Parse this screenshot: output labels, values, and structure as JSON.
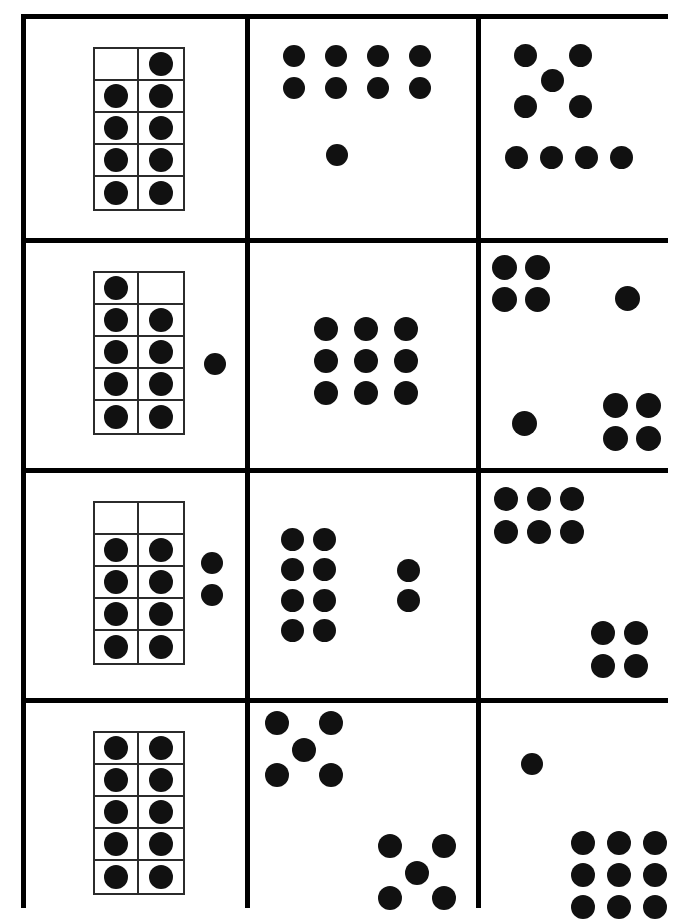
{
  "worksheet": {
    "title": "Ten-frame and dot pattern counting worksheet",
    "description": "A 3-column by 4-row grid of white cards on a black grid; each card shows a quantity of nine or ten black dots arranged in a different representation.",
    "ink_color": "#111111",
    "grid_color": "#000000",
    "card_color": "#ffffff",
    "frame_line_color": "#2b2b2b",
    "columns": 3,
    "rows": 4,
    "cards": [
      {
        "id": "r1c1",
        "row": 1,
        "column": 1,
        "representation": "ten-frame",
        "total_dots": 9,
        "filled_cells": 9,
        "empty_cells": 1,
        "empty_positions": "top-left",
        "groups": [
          {
            "label": "ten-frame",
            "count": 9
          }
        ]
      },
      {
        "id": "r1c2",
        "row": 1,
        "column": 2,
        "representation": "scattered-groups",
        "total_dots": 9,
        "groups": [
          {
            "label": "4-by-2 array",
            "count": 8
          },
          {
            "label": "single dot below",
            "count": 1
          }
        ]
      },
      {
        "id": "r1c3",
        "row": 1,
        "column": 3,
        "representation": "scattered-groups",
        "total_dots": 9,
        "groups": [
          {
            "label": "quincunx",
            "count": 5
          },
          {
            "label": "row of four",
            "count": 4
          }
        ]
      },
      {
        "id": "r2c1",
        "row": 2,
        "column": 1,
        "representation": "ten-frame-plus-loose",
        "total_dots": 10,
        "filled_cells": 9,
        "empty_cells": 1,
        "empty_positions": "top-right",
        "loose_dots": 1,
        "groups": [
          {
            "label": "ten-frame",
            "count": 9
          },
          {
            "label": "loose dots",
            "count": 1
          }
        ]
      },
      {
        "id": "r2c2",
        "row": 2,
        "column": 2,
        "representation": "array",
        "total_dots": 9,
        "groups": [
          {
            "label": "3-by-3 array",
            "count": 9
          }
        ]
      },
      {
        "id": "r2c3",
        "row": 2,
        "column": 3,
        "representation": "scattered-groups",
        "total_dots": 10,
        "groups": [
          {
            "label": "2-by-2 array top-left",
            "count": 4
          },
          {
            "label": "single dot top-right",
            "count": 1
          },
          {
            "label": "single dot bottom-left",
            "count": 1
          },
          {
            "label": "2-by-2 array bottom-right",
            "count": 4
          }
        ]
      },
      {
        "id": "r3c1",
        "row": 3,
        "column": 1,
        "representation": "ten-frame-plus-loose",
        "total_dots": 10,
        "filled_cells": 8,
        "empty_cells": 2,
        "empty_positions": "entire top row",
        "loose_dots": 2,
        "groups": [
          {
            "label": "ten-frame",
            "count": 8
          },
          {
            "label": "loose dots",
            "count": 2
          }
        ]
      },
      {
        "id": "r3c2",
        "row": 3,
        "column": 2,
        "representation": "scattered-groups",
        "total_dots": 10,
        "groups": [
          {
            "label": "4-by-2 array",
            "count": 8
          },
          {
            "label": "vertical pair",
            "count": 2
          }
        ]
      },
      {
        "id": "r3c3",
        "row": 3,
        "column": 3,
        "representation": "scattered-groups",
        "total_dots": 10,
        "groups": [
          {
            "label": "2-by-3 array top-left",
            "count": 6
          },
          {
            "label": "2-by-2 array bottom-right",
            "count": 4
          }
        ]
      },
      {
        "id": "r4c1",
        "row": 4,
        "column": 1,
        "representation": "ten-frame",
        "total_dots": 10,
        "filled_cells": 10,
        "empty_cells": 0,
        "empty_positions": "none",
        "groups": [
          {
            "label": "ten-frame",
            "count": 10
          }
        ]
      },
      {
        "id": "r4c2",
        "row": 4,
        "column": 2,
        "representation": "scattered-groups",
        "total_dots": 10,
        "groups": [
          {
            "label": "quincunx top-left",
            "count": 5
          },
          {
            "label": "quincunx bottom-right",
            "count": 5
          }
        ]
      },
      {
        "id": "r4c3",
        "row": 4,
        "column": 3,
        "representation": "scattered-groups",
        "total_dots": 10,
        "groups": [
          {
            "label": "single dot top-left",
            "count": 1
          },
          {
            "label": "3-by-3 array bottom-right",
            "count": 9
          }
        ]
      }
    ],
    "dot_layouts": {
      "r1c2": [
        [
          33,
          26,
          22
        ],
        [
          75,
          26,
          22
        ],
        [
          117,
          26,
          22
        ],
        [
          159,
          26,
          22
        ],
        [
          33,
          58,
          22
        ],
        [
          75,
          58,
          22
        ],
        [
          117,
          58,
          22
        ],
        [
          159,
          58,
          22
        ],
        [
          76,
          125,
          22
        ]
      ],
      "r1c3": [
        [
          33,
          25,
          23
        ],
        [
          88,
          25,
          23
        ],
        [
          60,
          50,
          23
        ],
        [
          33,
          76,
          23
        ],
        [
          88,
          76,
          23
        ],
        [
          24,
          127,
          23
        ],
        [
          59,
          127,
          23
        ],
        [
          94,
          127,
          23
        ],
        [
          129,
          127,
          23
        ]
      ],
      "r2c1_loose": [
        [
          178,
          110,
          22
        ]
      ],
      "r2c2": [
        [
          64,
          74,
          24
        ],
        [
          104,
          74,
          24
        ],
        [
          144,
          74,
          24
        ],
        [
          64,
          106,
          24
        ],
        [
          104,
          106,
          24
        ],
        [
          144,
          106,
          24
        ],
        [
          64,
          138,
          24
        ],
        [
          104,
          138,
          24
        ],
        [
          144,
          138,
          24
        ]
      ],
      "r2c3": [
        [
          11,
          12,
          25
        ],
        [
          44,
          12,
          25
        ],
        [
          11,
          44,
          25
        ],
        [
          44,
          44,
          25
        ],
        [
          134,
          43,
          25
        ],
        [
          31,
          168,
          25
        ],
        [
          122,
          150,
          25
        ],
        [
          155,
          150,
          25
        ],
        [
          122,
          183,
          25
        ],
        [
          155,
          183,
          25
        ]
      ],
      "r3c1_loose": [
        [
          175,
          79,
          22
        ],
        [
          175,
          111,
          22
        ]
      ],
      "r3c2": [
        [
          31,
          55,
          23
        ],
        [
          63,
          55,
          23
        ],
        [
          31,
          85,
          23
        ],
        [
          63,
          85,
          23
        ],
        [
          31,
          116,
          23
        ],
        [
          63,
          116,
          23
        ],
        [
          31,
          146,
          23
        ],
        [
          63,
          146,
          23
        ],
        [
          147,
          86,
          23
        ],
        [
          147,
          116,
          23
        ]
      ],
      "r3c3": [
        [
          13,
          14,
          24
        ],
        [
          46,
          14,
          24
        ],
        [
          79,
          14,
          24
        ],
        [
          13,
          47,
          24
        ],
        [
          46,
          47,
          24
        ],
        [
          79,
          47,
          24
        ],
        [
          110,
          148,
          24
        ],
        [
          143,
          148,
          24
        ],
        [
          110,
          181,
          24
        ],
        [
          143,
          181,
          24
        ]
      ],
      "r4c2": [
        [
          15,
          8,
          24
        ],
        [
          69,
          8,
          24
        ],
        [
          42,
          35,
          24
        ],
        [
          15,
          60,
          24
        ],
        [
          69,
          60,
          24
        ],
        [
          128,
          131,
          24
        ],
        [
          182,
          131,
          24
        ],
        [
          155,
          158,
          24
        ],
        [
          128,
          183,
          24
        ],
        [
          182,
          183,
          24
        ]
      ],
      "r4c3": [
        [
          40,
          50,
          22
        ],
        [
          90,
          128,
          24
        ],
        [
          126,
          128,
          24
        ],
        [
          162,
          128,
          24
        ],
        [
          90,
          160,
          24
        ],
        [
          126,
          160,
          24
        ],
        [
          162,
          160,
          24
        ],
        [
          90,
          192,
          24
        ],
        [
          126,
          192,
          24
        ],
        [
          162,
          192,
          24
        ]
      ]
    },
    "tenframe_positions": {
      "r1c1": {
        "left": 67,
        "top": 28,
        "width": 92,
        "height": 164,
        "filled": [
          0,
          1,
          1,
          1,
          1,
          1,
          1,
          1,
          1,
          1
        ]
      },
      "r2c1": {
        "left": 67,
        "top": 28,
        "width": 92,
        "height": 164,
        "filled": [
          1,
          0,
          1,
          1,
          1,
          1,
          1,
          1,
          1,
          1
        ]
      },
      "r3c1": {
        "left": 67,
        "top": 28,
        "width": 92,
        "height": 164,
        "filled": [
          0,
          0,
          1,
          1,
          1,
          1,
          1,
          1,
          1,
          1
        ]
      },
      "r4c1": {
        "left": 67,
        "top": 28,
        "width": 92,
        "height": 164,
        "filled": [
          1,
          1,
          1,
          1,
          1,
          1,
          1,
          1,
          1,
          1
        ]
      }
    }
  }
}
